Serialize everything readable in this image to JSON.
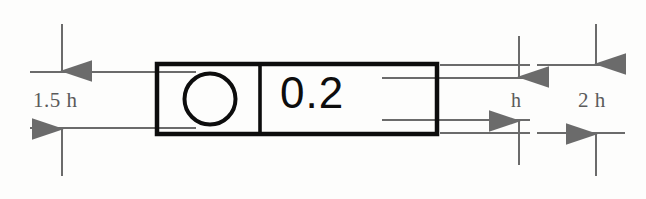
{
  "diagram": {
    "background_color": "#fdfdfc",
    "frame_color": "#0d0d0d",
    "dimension_color": "#6b6b6b",
    "text_color": "#5a5a5a"
  },
  "control_frame": {
    "symbol_name": "circularity-symbol",
    "symbol_description": "circle",
    "tolerance_value": "0.2",
    "compartments": [
      {
        "name": "symbol-compartment",
        "content": "circularity-symbol"
      },
      {
        "name": "tolerance-compartment",
        "content": "0.2"
      }
    ]
  },
  "dimensions": [
    {
      "id": "frame-height",
      "label": "1.5 h",
      "position": "left",
      "arrow_direction": "double-vertical",
      "measures": "overall frame box height"
    },
    {
      "id": "text-height",
      "label": "h",
      "position": "right-inner",
      "arrow_direction": "double-vertical",
      "measures": "character height"
    },
    {
      "id": "outer-height",
      "label": "2 h",
      "position": "right-outer",
      "arrow_direction": "double-vertical",
      "measures": "total annotation height"
    }
  ],
  "geometry": {
    "box": {
      "x": 157,
      "y": 64,
      "width": 280,
      "height": 70
    },
    "divider_x": 260,
    "circle": {
      "cx": 210,
      "cy": 99,
      "r": 25
    },
    "ext_lines_y": {
      "box_top": 65,
      "box_bottom": 133,
      "text_top": 78,
      "text_bottom": 120
    }
  }
}
